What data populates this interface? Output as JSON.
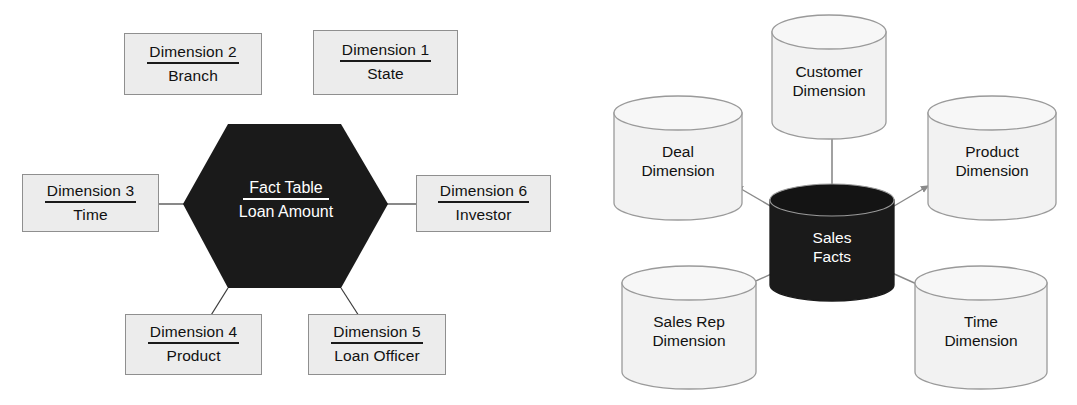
{
  "diagram": {
    "title_left": "Star schema with hexagonal fact table",
    "title_right": "Star schema with cylinder entities"
  },
  "star_schema": {
    "fact": {
      "title": "Fact Table",
      "subtitle": "Loan Amount",
      "shape": "hexagon",
      "fill": "#1a1a1a",
      "text_color": "#ffffff"
    },
    "box_fill": "#ececec",
    "box_border": "#8f8f8f",
    "dimensions": [
      {
        "id": "dimension-2",
        "title": "Dimension 2",
        "subtitle": "Branch",
        "position": "top-left"
      },
      {
        "id": "dimension-1",
        "title": "Dimension 1",
        "subtitle": "State",
        "position": "top-right"
      },
      {
        "id": "dimension-3",
        "title": "Dimension 3",
        "subtitle": "Time",
        "position": "left"
      },
      {
        "id": "dimension-6",
        "title": "Dimension 6",
        "subtitle": "Investor",
        "position": "right"
      },
      {
        "id": "dimension-4",
        "title": "Dimension 4",
        "subtitle": "Product",
        "position": "bottom-left"
      },
      {
        "id": "dimension-5",
        "title": "Dimension 5",
        "subtitle": "Loan Officer",
        "position": "bottom-right"
      }
    ]
  },
  "cylinder_schema": {
    "fact": {
      "line1": "Sales",
      "line2": "Facts",
      "fill": "#1a1a1a",
      "text_color": "#ffffff"
    },
    "cylinder_fill": "#f2f2f2",
    "cylinder_border": "#9a9a9a",
    "arrow_color": "#8a8a8a",
    "dimensions": [
      {
        "id": "customer-dimension",
        "line1": "Customer",
        "line2": "Dimension",
        "position": "top"
      },
      {
        "id": "deal-dimension",
        "line1": "Deal",
        "line2": "Dimension",
        "position": "upper-left"
      },
      {
        "id": "product-dimension",
        "line1": "Product",
        "line2": "Dimension",
        "position": "upper-right"
      },
      {
        "id": "sales-rep-dimension",
        "line1": "Sales Rep",
        "line2": "Dimension",
        "position": "lower-left"
      },
      {
        "id": "time-dimension",
        "line1": "Time",
        "line2": "Dimension",
        "position": "lower-right"
      }
    ]
  }
}
